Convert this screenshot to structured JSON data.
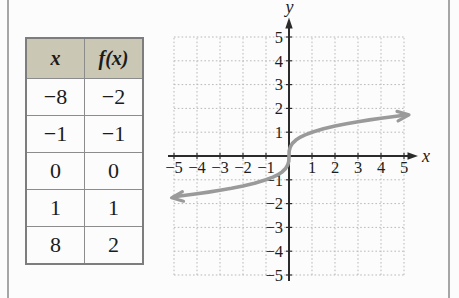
{
  "table": {
    "headers": [
      "x",
      "f(x)"
    ],
    "rows": [
      [
        "−8",
        "−2"
      ],
      [
        "−1",
        "−1"
      ],
      [
        "0",
        "0"
      ],
      [
        "1",
        "1"
      ],
      [
        "8",
        "2"
      ]
    ]
  },
  "graph": {
    "x_axis_label": "x",
    "y_axis_label": "y"
  },
  "colors": {
    "table_header_bg": "#cbc7b5",
    "curve": "#9a9a9a",
    "axis": "#2b2b2b",
    "grid_dots": "#b9b9b9"
  },
  "chart_data": {
    "type": "line",
    "points_from_table": [
      [
        -8,
        -2
      ],
      [
        -1,
        -1
      ],
      [
        0,
        0
      ],
      [
        1,
        1
      ],
      [
        8,
        2
      ]
    ],
    "xlabel": "x",
    "ylabel": "y",
    "xlim": [
      -5,
      5
    ],
    "ylim": [
      -5,
      5
    ],
    "grid": true,
    "x_ticks": [
      {
        "v": -5,
        "label": "−5"
      },
      {
        "v": -4,
        "label": "−4"
      },
      {
        "v": -3,
        "label": "−3"
      },
      {
        "v": -2,
        "label": "−2"
      },
      {
        "v": -1,
        "label": "−1"
      },
      {
        "v": 1,
        "label": "1"
      },
      {
        "v": 2,
        "label": "2"
      },
      {
        "v": 3,
        "label": "3"
      },
      {
        "v": 4,
        "label": "4"
      },
      {
        "v": 5,
        "label": "5"
      }
    ],
    "y_ticks": [
      {
        "v": 5,
        "label": "5"
      },
      {
        "v": 4,
        "label": "4"
      },
      {
        "v": 3,
        "label": "3"
      },
      {
        "v": 2,
        "label": "2"
      },
      {
        "v": 1,
        "label": "1"
      },
      {
        "v": -1,
        "label": "−1"
      },
      {
        "v": -2,
        "label": "−2"
      },
      {
        "v": -3,
        "label": "−3"
      },
      {
        "v": -4,
        "label": "−4"
      },
      {
        "v": -5,
        "label": "−5"
      }
    ],
    "curve_points": [
      [
        -5,
        -1.71
      ],
      [
        -4.5,
        -1.651
      ],
      [
        -4,
        -1.587
      ],
      [
        -3.5,
        -1.518
      ],
      [
        -3,
        -1.442
      ],
      [
        -2.5,
        -1.357
      ],
      [
        -2,
        -1.26
      ],
      [
        -1.5,
        -1.145
      ],
      [
        -1,
        -1
      ],
      [
        -0.7,
        -0.888
      ],
      [
        -0.5,
        -0.794
      ],
      [
        -0.3,
        -0.669
      ],
      [
        -0.15,
        -0.531
      ],
      [
        -0.05,
        -0.368
      ],
      [
        -0.01,
        -0.215
      ],
      [
        0,
        0
      ],
      [
        0.01,
        0.215
      ],
      [
        0.05,
        0.368
      ],
      [
        0.15,
        0.531
      ],
      [
        0.3,
        0.669
      ],
      [
        0.5,
        0.794
      ],
      [
        0.7,
        0.888
      ],
      [
        1,
        1
      ],
      [
        1.5,
        1.145
      ],
      [
        2,
        1.26
      ],
      [
        2.5,
        1.357
      ],
      [
        3,
        1.442
      ],
      [
        3.5,
        1.518
      ],
      [
        4,
        1.587
      ],
      [
        4.5,
        1.651
      ],
      [
        5,
        1.71
      ]
    ]
  }
}
